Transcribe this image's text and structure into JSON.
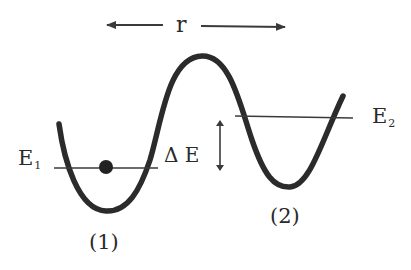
{
  "diagram": {
    "type": "double-well potential energy diagram",
    "axis_label": "r",
    "wells": [
      {
        "id": "1",
        "label": "(1)",
        "energy_level": "E",
        "energy_subscript": "1",
        "occupied": true
      },
      {
        "id": "2",
        "label": "(2)",
        "energy_level": "E",
        "energy_subscript": "2",
        "occupied": false
      }
    ],
    "energy_gap_label": "Δ E",
    "colors": {
      "curve": "#2b2b2b",
      "lines": "#3a3a3a",
      "particle": "#222222",
      "background": "#ffffff"
    }
  }
}
